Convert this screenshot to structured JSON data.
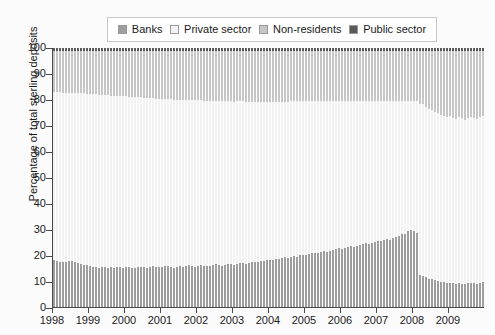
{
  "chart_data": {
    "type": "bar",
    "stacked": true,
    "title": "",
    "subtitle": "",
    "xlabel": "",
    "ylabel": "Percentage of total sterling deposits",
    "ylim": [
      0,
      100
    ],
    "ytick_labels": [
      "0",
      "10",
      "20",
      "30",
      "40",
      "50",
      "60",
      "70",
      "80",
      "90",
      "100"
    ],
    "ytick_values": [
      0,
      10,
      20,
      30,
      40,
      50,
      60,
      70,
      80,
      90,
      100
    ],
    "xtick_labels": [
      "1998",
      "1999",
      "2000",
      "2001",
      "2002",
      "2003",
      "2004",
      "2005",
      "2006",
      "2007",
      "2008",
      "2009"
    ],
    "x_range": [
      "1998",
      "2010"
    ],
    "grid": false,
    "legend_position": "top-center",
    "legend": [
      {
        "label": "Banks",
        "color": "#9e9e9e"
      },
      {
        "label": "Private sector",
        "color": "#f2f2f2"
      },
      {
        "label": "Non-residents",
        "color": "#c6c6c6"
      },
      {
        "label": "Public sector",
        "color": "#5a5a5a"
      }
    ],
    "stack_order_bottom_to_top": [
      "Banks",
      "Private sector",
      "Non-residents",
      "Public sector"
    ],
    "series": [
      {
        "name": "Banks",
        "color": "#9e9e9e",
        "values": [
          18,
          17.8,
          17.5,
          17.2,
          17.4,
          17.9,
          17.6,
          17.3,
          17.0,
          16.6,
          16.3,
          16.1,
          15.8,
          15.6,
          15.4,
          15.2,
          15.5,
          15.3,
          15.1,
          15.4,
          15.2,
          15.6,
          15.3,
          15.1,
          15.3,
          15.5,
          15.2,
          15.0,
          15.3,
          15.6,
          15.4,
          15.2,
          15.5,
          15.8,
          15.6,
          15.3,
          15.6,
          15.9,
          15.7,
          15.4,
          15.2,
          15.5,
          15.8,
          15.6,
          15.9,
          16.1,
          15.8,
          15.6,
          15.9,
          16.2,
          16.0,
          15.7,
          16.0,
          16.3,
          16.5,
          16.2,
          16.0,
          16.4,
          16.7,
          16.5,
          16.2,
          16.6,
          16.9,
          17.1,
          16.8,
          17.0,
          17.3,
          17.5,
          17.2,
          17.6,
          17.9,
          18.1,
          18.3,
          18.0,
          18.4,
          18.7,
          18.9,
          19.2,
          19.0,
          19.4,
          19.7,
          19.5,
          19.9,
          20.2,
          20.0,
          20.4,
          20.7,
          21.0,
          20.8,
          21.2,
          21.5,
          21.3,
          21.7,
          22.0,
          22.3,
          22.6,
          22.4,
          22.8,
          23.1,
          23.4,
          23.2,
          23.6,
          24.0,
          24.3,
          24.6,
          24.4,
          24.8,
          25.1,
          25.5,
          25.3,
          25.8,
          26.2,
          26.0,
          26.5,
          27.0,
          27.4,
          28.2,
          28.0,
          29.4,
          29.6,
          29.2,
          28.4,
          12.2,
          11.8,
          11.4,
          11.0,
          10.8,
          10.4,
          10.1,
          9.8,
          9.5,
          9.2,
          9.4,
          9.1,
          8.9,
          9.2,
          9.0,
          8.8,
          9.1,
          9.4,
          9.2,
          9.0,
          9.3,
          9.6
        ]
      },
      {
        "name": "Private sector",
        "color": "#f2f2f2",
        "values": [
          65.0,
          65.2,
          65.4,
          65.6,
          65.3,
          64.8,
          65.1,
          65.4,
          65.7,
          66.0,
          66.2,
          66.3,
          66.5,
          66.6,
          66.7,
          66.8,
          66.4,
          66.5,
          66.6,
          66.2,
          66.3,
          65.9,
          66.1,
          66.2,
          66.0,
          65.7,
          65.9,
          66.0,
          65.7,
          65.3,
          65.4,
          65.5,
          65.1,
          64.8,
          64.9,
          65.1,
          64.8,
          64.5,
          64.6,
          64.8,
          64.9,
          64.6,
          64.3,
          64.4,
          64.1,
          63.9,
          64.1,
          64.2,
          63.9,
          63.6,
          63.7,
          63.9,
          63.6,
          63.3,
          63.1,
          63.3,
          63.4,
          63.1,
          62.8,
          62.9,
          63.1,
          62.8,
          62.5,
          62.3,
          62.5,
          62.3,
          62.0,
          61.8,
          62.0,
          61.7,
          61.4,
          61.2,
          61.0,
          61.2,
          60.9,
          60.6,
          60.4,
          60.1,
          60.3,
          60.0,
          59.7,
          59.9,
          59.5,
          59.2,
          59.4,
          59.0,
          58.7,
          58.4,
          58.6,
          58.2,
          57.9,
          58.1,
          57.7,
          57.4,
          57.1,
          56.8,
          57.0,
          56.6,
          56.3,
          56.0,
          56.2,
          55.8,
          55.4,
          55.1,
          54.8,
          55.0,
          54.6,
          54.3,
          53.9,
          54.1,
          53.6,
          53.2,
          53.4,
          52.9,
          52.4,
          52.0,
          51.2,
          51.4,
          50.0,
          49.8,
          50.2,
          51.0,
          66.0,
          66.4,
          66.0,
          65.6,
          65.4,
          65.0,
          64.8,
          64.5,
          64.2,
          64.0,
          64.2,
          64.0,
          63.8,
          64.0,
          63.8,
          63.6,
          63.9,
          64.1,
          63.9,
          63.7,
          64.0,
          64.2
        ]
      },
      {
        "name": "Non-residents",
        "color": "#c6c6c6",
        "values": [
          16.0,
          16.0,
          16.1,
          16.2,
          16.3,
          16.3,
          16.3,
          16.3,
          16.3,
          16.4,
          16.5,
          16.6,
          16.7,
          16.8,
          16.9,
          17.0,
          17.1,
          17.2,
          17.3,
          17.4,
          17.5,
          17.5,
          17.6,
          17.7,
          17.7,
          17.8,
          17.9,
          18.0,
          18.0,
          18.1,
          18.2,
          18.3,
          18.4,
          18.4,
          18.5,
          18.6,
          18.6,
          18.6,
          18.7,
          18.8,
          18.9,
          18.9,
          18.9,
          19.0,
          19.0,
          19.0,
          19.1,
          19.2,
          19.2,
          19.2,
          19.3,
          19.4,
          19.4,
          19.4,
          19.4,
          19.5,
          19.6,
          19.5,
          19.5,
          19.6,
          19.7,
          19.6,
          19.6,
          19.6,
          19.7,
          19.7,
          19.7,
          19.7,
          19.8,
          19.7,
          19.7,
          19.7,
          19.7,
          19.8,
          19.7,
          19.7,
          19.7,
          19.7,
          19.7,
          19.6,
          19.6,
          19.6,
          19.6,
          19.6,
          19.6,
          19.6,
          19.6,
          19.6,
          19.6,
          19.6,
          19.6,
          19.6,
          19.6,
          19.6,
          19.6,
          19.6,
          19.6,
          19.6,
          19.6,
          19.6,
          19.6,
          19.6,
          19.6,
          19.6,
          19.6,
          19.6,
          19.6,
          19.6,
          19.6,
          19.6,
          19.6,
          19.6,
          19.6,
          19.6,
          19.6,
          19.6,
          19.6,
          19.6,
          19.6,
          19.6,
          19.6,
          19.6,
          20.8,
          20.8,
          21.6,
          22.4,
          22.8,
          23.6,
          24.1,
          24.7,
          25.3,
          25.8,
          25.4,
          25.9,
          26.3,
          25.8,
          26.2,
          26.6,
          26.0,
          25.5,
          25.9,
          26.3,
          25.7,
          25.2
        ]
      },
      {
        "name": "Public sector",
        "color": "#5a5a5a",
        "values": [
          1.0,
          1.0,
          1.0,
          1.0,
          1.0,
          1.0,
          1.0,
          1.0,
          1.0,
          1.0,
          1.0,
          1.0,
          1.0,
          1.0,
          1.0,
          1.0,
          1.0,
          1.0,
          1.0,
          1.0,
          1.0,
          1.0,
          1.0,
          1.0,
          1.0,
          1.0,
          1.0,
          1.0,
          1.0,
          1.0,
          1.0,
          1.0,
          1.0,
          1.0,
          1.0,
          1.0,
          1.0,
          1.0,
          1.0,
          1.0,
          1.0,
          1.0,
          1.0,
          1.0,
          1.0,
          1.0,
          1.0,
          1.0,
          1.0,
          1.0,
          1.0,
          1.0,
          1.0,
          1.0,
          1.0,
          1.0,
          1.0,
          1.0,
          1.0,
          1.0,
          1.0,
          1.0,
          1.0,
          1.0,
          1.0,
          1.0,
          1.0,
          1.0,
          1.0,
          1.0,
          1.0,
          1.0,
          1.0,
          1.0,
          1.0,
          1.0,
          1.0,
          1.0,
          1.0,
          1.0,
          1.0,
          1.0,
          1.0,
          1.0,
          1.0,
          1.0,
          1.0,
          1.0,
          1.0,
          1.0,
          1.0,
          1.0,
          1.0,
          1.0,
          1.0,
          1.0,
          1.0,
          1.0,
          1.0,
          1.0,
          1.0,
          1.0,
          1.0,
          1.0,
          1.0,
          1.0,
          1.0,
          1.0,
          1.0,
          1.0,
          1.0,
          1.0,
          1.0,
          1.0,
          1.0,
          1.0,
          1.0,
          1.0,
          1.0,
          1.0,
          1.0,
          1.0,
          1.0,
          1.0,
          1.0,
          1.0,
          1.0,
          1.0,
          1.0,
          1.0,
          1.0,
          1.0,
          1.0,
          1.0,
          1.0,
          1.0,
          1.0,
          1.0,
          1.0,
          1.0,
          1.0,
          1.0,
          1.0,
          1.0
        ]
      }
    ]
  }
}
